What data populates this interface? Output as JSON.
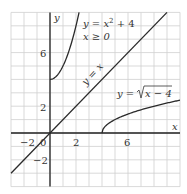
{
  "chart_data": {
    "type": "line",
    "title": "",
    "xlabel": "x",
    "ylabel": "y",
    "xlim": [
      -3,
      10
    ],
    "ylim": [
      -4,
      9
    ],
    "grid": true,
    "x_ticks": [
      -2,
      0,
      2,
      6
    ],
    "x_tick_labels": [
      "−2",
      "0",
      "2",
      "6"
    ],
    "y_ticks": [
      6,
      2,
      -2
    ],
    "y_tick_labels": [
      "6",
      "2",
      "−2"
    ],
    "series": [
      {
        "name": "y = x² + 4, x ≥ 0",
        "label_line1": "y = x",
        "label_sup": "2",
        "label_line1_tail": " + 4",
        "label_line2": "x ≥ 0",
        "domain": [
          0,
          2.236
        ],
        "points": [
          [
            0,
            4
          ],
          [
            0.5,
            4.25
          ],
          [
            1,
            5
          ],
          [
            1.5,
            6.25
          ],
          [
            2,
            8
          ],
          [
            2.236,
            9
          ]
        ]
      },
      {
        "name": "y = x",
        "label": "y = x",
        "domain": [
          -3,
          9
        ],
        "points": [
          [
            -3,
            -3
          ],
          [
            9,
            9
          ]
        ]
      },
      {
        "name": "y = √(x − 4)",
        "label_prefix": "y = ",
        "label_radicand": "x − 4",
        "domain": [
          4,
          10
        ],
        "points": [
          [
            4,
            0
          ],
          [
            4.25,
            0.5
          ],
          [
            5,
            1
          ],
          [
            6,
            1.414
          ],
          [
            7,
            1.732
          ],
          [
            8,
            2
          ],
          [
            9,
            2.236
          ],
          [
            10,
            2.449
          ]
        ]
      }
    ]
  },
  "axes": {
    "x_label": "x",
    "y_label": "y"
  }
}
